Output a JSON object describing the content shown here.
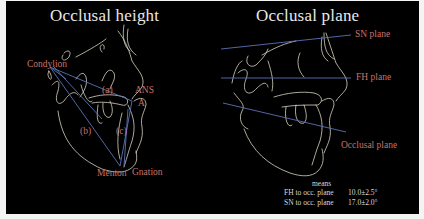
{
  "colors": {
    "background": "#000000",
    "border": "#f4f4f4",
    "title_text": "#e8e8e8",
    "landmark_text": "#c9726a",
    "reference_line": "#5a72b8",
    "tracing": "#d9d4c2",
    "means_text": "#d8d8d8"
  },
  "left_panel": {
    "title": "Occlusal height",
    "landmarks": {
      "condylion": "Condylion",
      "ans": "ANS",
      "a_point": "A",
      "menton": "Menton",
      "gnation": "Gnation"
    },
    "measurements": {
      "a": "(a)",
      "b": "(b)",
      "c": "(c)"
    }
  },
  "right_panel": {
    "title": "Occlusal plane",
    "planes": {
      "sn": "SN plane",
      "fh": "FH plane",
      "occlusal": "Occlusal plane"
    },
    "means": {
      "header": "means",
      "rows": [
        {
          "label": "FH to occ. plane",
          "value": "10.0±2.5°"
        },
        {
          "label": "SN to occ. plane",
          "value": "17.0±2.0°"
        }
      ]
    }
  }
}
